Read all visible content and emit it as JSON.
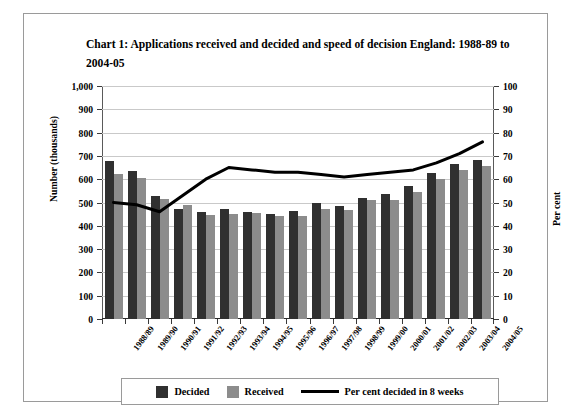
{
  "title": "Chart 1: Applications received and decided and speed of decision England: 1988-89 to 2004-05",
  "legend": {
    "decided": "Decided",
    "received": "Received",
    "percent": "Per cent decided in 8 weeks"
  },
  "colors": {
    "decided": "#303030",
    "received": "#8c8c8c",
    "line": "#000000",
    "grid": "#c9c9c9",
    "frame": "#9a9a9a"
  },
  "chart_data": {
    "type": "bar",
    "title": "Chart 1: Applications received and decided and speed of decision England: 1988-89 to 2004-05",
    "xlabel": "",
    "ylabel": "Number (thousands)",
    "y2label": "Per cent",
    "ylim": [
      0,
      1000
    ],
    "y2lim": [
      0,
      100
    ],
    "yticks": [
      "0",
      "100",
      "200",
      "300",
      "400",
      "500",
      "600",
      "700",
      "800",
      "900",
      "1,000"
    ],
    "y2ticks": [
      "0",
      "10",
      "20",
      "30",
      "40",
      "50",
      "60",
      "70",
      "80",
      "90",
      "100"
    ],
    "grid": true,
    "legend_position": "bottom",
    "categories": [
      "1988/89",
      "1989/90",
      "1990/91",
      "1991/92",
      "1992/93",
      "1993/94",
      "1994/95",
      "1995/96",
      "1996/97",
      "1997/98",
      "1998/99",
      "1999/00",
      "2000/01",
      "2001/02",
      "2002/03",
      "2003/04",
      "2004/05"
    ],
    "series": [
      {
        "name": "Decided",
        "axis": "left",
        "type": "bar",
        "values": [
          678,
          637,
          530,
          473,
          458,
          472,
          461,
          452,
          462,
          497,
          487,
          521,
          536,
          570,
          625,
          664,
          681
        ]
      },
      {
        "name": "Received",
        "axis": "left",
        "type": "bar",
        "values": [
          622,
          607,
          513,
          488,
          447,
          452,
          457,
          442,
          444,
          474,
          470,
          509,
          512,
          545,
          600,
          638,
          655
        ]
      },
      {
        "name": "Per cent decided in 8 weeks",
        "axis": "right",
        "type": "line",
        "values": [
          50,
          49,
          46,
          53,
          60,
          65,
          64,
          63,
          63,
          62,
          61,
          62,
          63,
          64,
          67,
          71,
          76
        ]
      }
    ]
  }
}
